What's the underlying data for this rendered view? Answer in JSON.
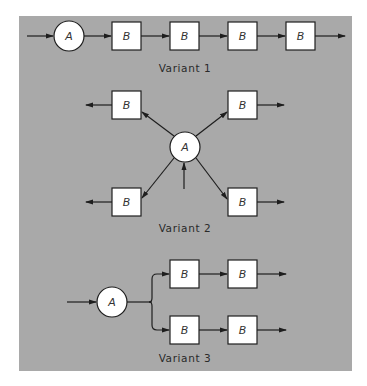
{
  "colors": {
    "panel": "#a9a9a9",
    "node_fill": "#ffffff",
    "stroke": "#1e1e1e"
  },
  "variant1": {
    "caption": "Variant 1",
    "source": {
      "label": "A"
    },
    "stages": [
      {
        "label": "B"
      },
      {
        "label": "B"
      },
      {
        "label": "B"
      },
      {
        "label": "B"
      }
    ]
  },
  "variant2": {
    "caption": "Variant 2",
    "hub": {
      "label": "A"
    },
    "branches": [
      {
        "label": "B",
        "position": "top-left"
      },
      {
        "label": "B",
        "position": "top-right"
      },
      {
        "label": "B",
        "position": "bottom-left"
      },
      {
        "label": "B",
        "position": "bottom-right"
      }
    ]
  },
  "variant3": {
    "caption": "Variant 3",
    "source": {
      "label": "A"
    },
    "upper_path": [
      {
        "label": "B"
      },
      {
        "label": "B"
      }
    ],
    "lower_path": [
      {
        "label": "B"
      },
      {
        "label": "B"
      }
    ]
  }
}
